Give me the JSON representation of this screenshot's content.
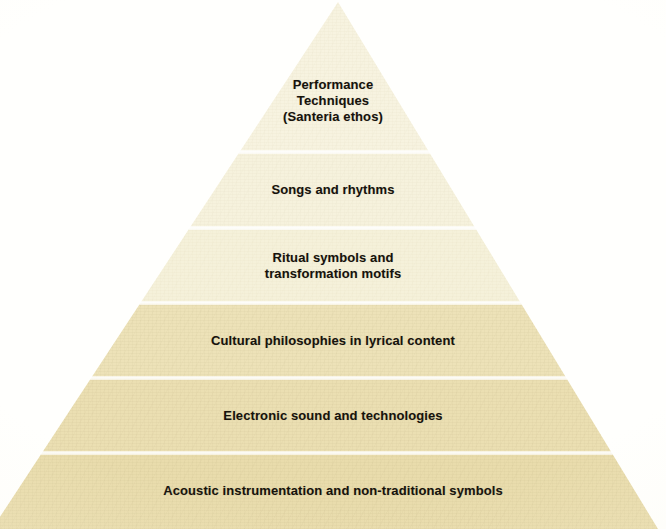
{
  "figure": {
    "type": "pyramid",
    "name": "cultural-hierarchy-pyramid",
    "tier_count": 6,
    "background_color": "#fffffd",
    "text_color": "#16120c",
    "apex": {
      "x": 338,
      "y": 2
    },
    "base_y": 529,
    "base_left_x": -8,
    "base_right_x": 658,
    "tiers": [
      {
        "index": 1,
        "position": "top",
        "label": "Performance\nTechniques\n(Santeria ethos)",
        "label_lines": [
          "Performance",
          "Techniques",
          "(Santeria ethos)"
        ],
        "top_y": 2,
        "bottom_y": 152,
        "fill_color": "#f7f3e0",
        "font_size": 13
      },
      {
        "index": 2,
        "position": "upper",
        "label": "Songs and rhythms",
        "label_lines": [
          "Songs and rhythms"
        ],
        "top_y": 152,
        "bottom_y": 228,
        "fill_color": "#f6f2dd",
        "font_size": 13
      },
      {
        "index": 3,
        "position": "upper-middle",
        "label": "Ritual symbols and\ntransformation motifs",
        "label_lines": [
          "Ritual symbols and",
          "transformation motifs"
        ],
        "top_y": 228,
        "bottom_y": 303,
        "fill_color": "#f5f1da",
        "font_size": 13
      },
      {
        "index": 4,
        "position": "lower-middle",
        "label": "Cultural philosophies in lyrical content",
        "label_lines": [
          "Cultural philosophies in lyrical content"
        ],
        "top_y": 303,
        "bottom_y": 378,
        "fill_color": "#ede2b8",
        "font_size": 13
      },
      {
        "index": 5,
        "position": "lower",
        "label": "Electronic sound and technologies",
        "label_lines": [
          "Electronic sound and technologies"
        ],
        "top_y": 378,
        "bottom_y": 453,
        "fill_color": "#ebdfb2",
        "font_size": 13
      },
      {
        "index": 6,
        "position": "base",
        "label": "Acoustic instrumentation and non-traditional symbols",
        "label_lines": [
          "Acoustic instrumentation and non-traditional symbols"
        ],
        "top_y": 453,
        "bottom_y": 529,
        "fill_color": "#e9dcac",
        "font_size": 13
      }
    ],
    "dividers": [
      152,
      228,
      303,
      378,
      453
    ]
  }
}
